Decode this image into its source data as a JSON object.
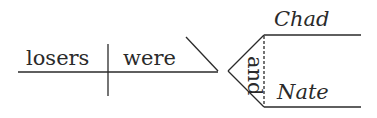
{
  "diagram": {
    "type": "sentence-diagram",
    "subject": "losers",
    "verb": "were",
    "conjunction": "and",
    "compound_complement": [
      "Chad",
      "Nate"
    ],
    "colors": {
      "ink": "#2a2a2a",
      "background": "#ffffff"
    }
  }
}
